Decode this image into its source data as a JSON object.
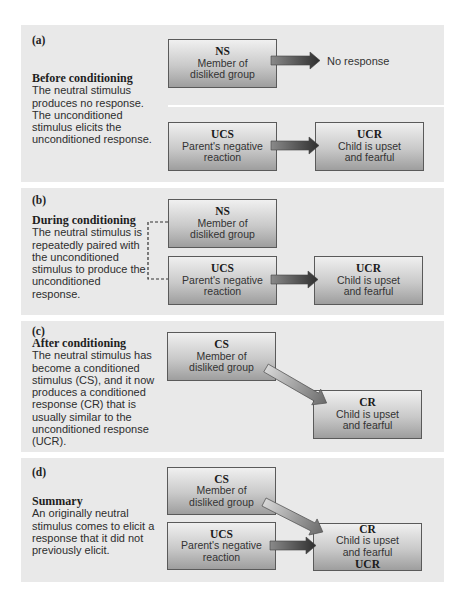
{
  "panels": [
    {
      "id": "a",
      "label": "(a)",
      "title": "Before conditioning",
      "description": "The neutral stimulus produces no response. The unconditioned stimulus elicits the unconditioned response.",
      "boxes": {
        "ns": {
          "abbr": "NS",
          "line1": "Member of",
          "line2": "disliked group"
        },
        "ucs": {
          "abbr": "UCS",
          "line1": "Parent's negative",
          "line2": "reaction"
        },
        "ucr": {
          "abbr": "UCR",
          "line1": "Child is upset",
          "line2": "and fearful"
        }
      },
      "no_response": "No response"
    },
    {
      "id": "b",
      "label": "(b)",
      "title": "During conditioning",
      "description": "The neutral stimulus is repeatedly paired with the unconditioned stimulus to produce the unconditioned response.",
      "boxes": {
        "ns": {
          "abbr": "NS",
          "line1": "Member of",
          "line2": "disliked group"
        },
        "ucs": {
          "abbr": "UCS",
          "line1": "Parent's negative",
          "line2": "reaction"
        },
        "ucr": {
          "abbr": "UCR",
          "line1": "Child is upset",
          "line2": "and fearful"
        }
      }
    },
    {
      "id": "c",
      "label": "(c)",
      "title": "After conditioning",
      "description": "The neutral stimulus has become a conditioned stimulus (CS), and it now produces a conditioned response (CR) that is usually similar to the unconditioned response (UCR).",
      "boxes": {
        "cs": {
          "abbr": "CS",
          "line1": "Member of",
          "line2": "disliked group"
        },
        "cr": {
          "abbr": "CR",
          "line1": "Child is upset",
          "line2": "and fearful"
        }
      }
    },
    {
      "id": "d",
      "label": "(d)",
      "title": "Summary",
      "description": "An originally neutral stimulus comes to elicit a response that it did not previously elicit.",
      "boxes": {
        "cs": {
          "abbr": "CS",
          "line1": "Member of",
          "line2": "disliked group"
        },
        "ucs": {
          "abbr": "UCS",
          "line1": "Parent's negative",
          "line2": "reaction"
        },
        "cr": {
          "abbr": "CR",
          "line1": "Child is upset",
          "line2": "and fearful",
          "abbr2": "UCR"
        }
      }
    }
  ],
  "colors": {
    "panel_bg": "#e9e9e9",
    "box_border": "#5a5a5a",
    "arrow_dark": "#3a3a3a",
    "arrow_light": "#b5b5b5"
  }
}
